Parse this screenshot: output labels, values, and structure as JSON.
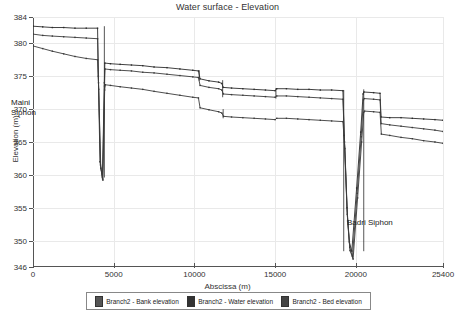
{
  "chart_data": {
    "type": "line",
    "title": "Water surface - Elevation",
    "xlabel": "Abscissa (m)",
    "ylabel": "Elevation (m)",
    "xlim": [
      0,
      25400
    ],
    "ylim": [
      346,
      384
    ],
    "xticks": [
      0,
      5000,
      10000,
      15000,
      20000,
      25400
    ],
    "xtick_labels": [
      "0",
      "5000",
      "10000",
      "15000",
      "20000",
      "25400"
    ],
    "yticks": [
      346,
      350,
      355,
      360,
      365,
      370,
      375,
      380,
      384
    ],
    "ytick_labels": [
      "346",
      "350",
      "355",
      "360",
      "365",
      "370",
      "375",
      "380",
      "384"
    ],
    "grid": true,
    "legend_position": "bottom",
    "annotations": [
      {
        "text": "Maini\nSiphon",
        "x": 1200,
        "y": 369.5
      },
      {
        "text": "Badri Siphon",
        "x": 21800,
        "y": 351.5
      }
    ],
    "series": [
      {
        "name": "Branch2 - Bank elevation",
        "color": "#2b2b2b",
        "points": [
          [
            0,
            382.6
          ],
          [
            600,
            382.5
          ],
          [
            1200,
            382.4
          ],
          [
            1900,
            382.4
          ],
          [
            2600,
            382.3
          ],
          [
            3300,
            382.3
          ],
          [
            4000,
            382.3
          ],
          [
            4050,
            375.0
          ],
          [
            4150,
            362.0
          ],
          [
            4300,
            359.6
          ],
          [
            4420,
            374.0
          ],
          [
            4450,
            377.0
          ],
          [
            4800,
            376.9
          ],
          [
            5400,
            376.8
          ],
          [
            6100,
            376.7
          ],
          [
            6800,
            376.6
          ],
          [
            7500,
            376.4
          ],
          [
            8300,
            376.3
          ],
          [
            9100,
            376.1
          ],
          [
            9900,
            375.9
          ],
          [
            10250,
            375.8
          ],
          [
            10350,
            374.6
          ],
          [
            10900,
            374.3
          ],
          [
            11500,
            374.1
          ],
          [
            11700,
            373.9
          ],
          [
            11780,
            373.3
          ],
          [
            12300,
            373.2
          ],
          [
            13000,
            373.1
          ],
          [
            13700,
            373.0
          ],
          [
            14400,
            372.9
          ],
          [
            15000,
            372.8
          ],
          [
            15100,
            373.1
          ],
          [
            15700,
            373.1
          ],
          [
            16400,
            373.0
          ],
          [
            17100,
            373.0
          ],
          [
            17800,
            372.9
          ],
          [
            18500,
            372.9
          ],
          [
            19200,
            372.8
          ],
          [
            19280,
            366.0
          ],
          [
            19450,
            355.0
          ],
          [
            19600,
            349.8
          ],
          [
            19750,
            348.4
          ],
          [
            20050,
            358.0
          ],
          [
            20300,
            366.5
          ],
          [
            20450,
            372.3
          ],
          [
            20500,
            372.6
          ],
          [
            21100,
            372.5
          ],
          [
            21500,
            372.4
          ],
          [
            21560,
            368.8
          ],
          [
            22100,
            368.7
          ],
          [
            22800,
            368.7
          ],
          [
            23500,
            368.6
          ],
          [
            24200,
            368.5
          ],
          [
            24900,
            368.4
          ],
          [
            25400,
            368.3
          ]
        ]
      },
      {
        "name": "Branch2 - Water elevation",
        "color": "#3a3a3a",
        "points": [
          [
            0,
            381.4
          ],
          [
            600,
            381.2
          ],
          [
            1200,
            381.1
          ],
          [
            1900,
            381.0
          ],
          [
            2600,
            380.9
          ],
          [
            3300,
            380.8
          ],
          [
            4000,
            380.7
          ],
          [
            4060,
            374.0
          ],
          [
            4180,
            361.5
          ],
          [
            4310,
            359.4
          ],
          [
            4430,
            373.5
          ],
          [
            4460,
            376.1
          ],
          [
            4800,
            376.0
          ],
          [
            5400,
            375.9
          ],
          [
            6100,
            375.8
          ],
          [
            6800,
            375.6
          ],
          [
            7500,
            375.5
          ],
          [
            8300,
            375.3
          ],
          [
            9100,
            375.1
          ],
          [
            9900,
            374.9
          ],
          [
            10250,
            374.8
          ],
          [
            10350,
            373.6
          ],
          [
            10900,
            373.3
          ],
          [
            11500,
            373.1
          ],
          [
            11700,
            372.9
          ],
          [
            11790,
            372.3
          ],
          [
            12300,
            372.2
          ],
          [
            13000,
            372.1
          ],
          [
            13700,
            372.0
          ],
          [
            14400,
            371.9
          ],
          [
            15000,
            371.8
          ],
          [
            15100,
            372.0
          ],
          [
            15700,
            372.0
          ],
          [
            16400,
            371.9
          ],
          [
            17100,
            371.8
          ],
          [
            17800,
            371.7
          ],
          [
            18500,
            371.6
          ],
          [
            19200,
            371.5
          ],
          [
            19300,
            365.0
          ],
          [
            19470,
            354.0
          ],
          [
            19620,
            349.0
          ],
          [
            19790,
            347.6
          ],
          [
            20080,
            357.2
          ],
          [
            20330,
            365.8
          ],
          [
            20470,
            371.4
          ],
          [
            20520,
            371.6
          ],
          [
            21100,
            371.5
          ],
          [
            21500,
            371.4
          ],
          [
            21570,
            367.8
          ],
          [
            22100,
            367.6
          ],
          [
            22800,
            367.4
          ],
          [
            23500,
            367.2
          ],
          [
            24200,
            367.0
          ],
          [
            24900,
            366.8
          ],
          [
            25400,
            366.6
          ]
        ]
      },
      {
        "name": "Branch2 - Bed elevation",
        "color": "#3a3a3a",
        "points": [
          [
            0,
            379.6
          ],
          [
            600,
            379.2
          ],
          [
            1200,
            378.8
          ],
          [
            1900,
            378.4
          ],
          [
            2600,
            378.0
          ],
          [
            3300,
            377.7
          ],
          [
            4000,
            377.5
          ],
          [
            4070,
            373.0
          ],
          [
            4200,
            361.0
          ],
          [
            4330,
            359.2
          ],
          [
            4440,
            372.9
          ],
          [
            4480,
            373.7
          ],
          [
            4800,
            373.6
          ],
          [
            5400,
            373.4
          ],
          [
            6100,
            373.2
          ],
          [
            6800,
            373.0
          ],
          [
            7500,
            372.7
          ],
          [
            8300,
            372.4
          ],
          [
            9100,
            372.1
          ],
          [
            9900,
            371.8
          ],
          [
            10250,
            371.7
          ],
          [
            10350,
            370.2
          ],
          [
            10900,
            369.9
          ],
          [
            11500,
            369.6
          ],
          [
            11700,
            369.4
          ],
          [
            11800,
            368.9
          ],
          [
            12300,
            368.8
          ],
          [
            13000,
            368.7
          ],
          [
            13700,
            368.6
          ],
          [
            14400,
            368.5
          ],
          [
            15000,
            368.4
          ],
          [
            15100,
            368.6
          ],
          [
            15700,
            368.6
          ],
          [
            16400,
            368.5
          ],
          [
            17100,
            368.4
          ],
          [
            17800,
            368.3
          ],
          [
            18500,
            368.2
          ],
          [
            19200,
            368.1
          ],
          [
            19320,
            364.0
          ],
          [
            19490,
            353.0
          ],
          [
            19640,
            348.5
          ],
          [
            19830,
            347.2
          ],
          [
            20110,
            356.5
          ],
          [
            20360,
            365.0
          ],
          [
            20490,
            369.5
          ],
          [
            20540,
            369.7
          ],
          [
            21100,
            369.6
          ],
          [
            21500,
            369.5
          ],
          [
            21580,
            366.2
          ],
          [
            22100,
            366.0
          ],
          [
            22800,
            365.7
          ],
          [
            23500,
            365.5
          ],
          [
            24200,
            365.2
          ],
          [
            24900,
            365.0
          ],
          [
            25400,
            364.8
          ]
        ]
      }
    ],
    "structure_markers": [
      {
        "x": 4420,
        "y0": 382.6,
        "y1": 359.6
      },
      {
        "x": 10300,
        "y0": 375.9,
        "y1": 374.3
      },
      {
        "x": 11750,
        "y0": 374.4,
        "y1": 371.8
      },
      {
        "x": 11780,
        "y0": 370.0,
        "y1": 368.6
      },
      {
        "x": 15050,
        "y0": 373.2,
        "y1": 371.6
      },
      {
        "x": 19250,
        "y0": 372.9,
        "y1": 348.4
      },
      {
        "x": 20490,
        "y0": 373.0,
        "y1": 348.4
      }
    ]
  },
  "legend": {
    "items": [
      {
        "label": "Branch2 - Bank elevation",
        "color": "#555555"
      },
      {
        "label": "Branch2 - Water elevation",
        "color": "#333333"
      },
      {
        "label": "Branch2 - Bed elevation",
        "color": "#444444"
      }
    ]
  }
}
